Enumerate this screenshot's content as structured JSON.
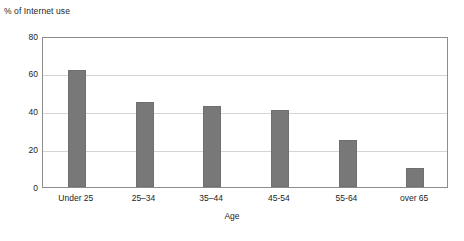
{
  "chart_data": {
    "type": "bar",
    "title": "",
    "categories": [
      "Under 25",
      "25–34",
      "35–44",
      "45-54",
      "55-64",
      "over 65"
    ],
    "values": [
      62,
      45,
      43,
      41,
      25,
      10
    ],
    "series": [
      {
        "name": "% of Internet use",
        "values": [
          62,
          45,
          43,
          41,
          25,
          10
        ]
      }
    ],
    "xlabel": "Age",
    "ylabel": "% of Internet use",
    "ylim": [
      0,
      80
    ],
    "yticks": [
      0,
      20,
      40,
      60,
      80
    ],
    "ytick_labels": [
      "0",
      "20",
      "40",
      "60",
      "80"
    ],
    "grid": "horizontal",
    "legend": "none",
    "bar_color": "#787878",
    "gridline_color": "#d5d5d5",
    "axis_color": "#8d8d8d",
    "background_color": "#ffffff"
  },
  "labels": {
    "y_axis_caption": "% of Internet use",
    "x_axis_title": "Age"
  }
}
